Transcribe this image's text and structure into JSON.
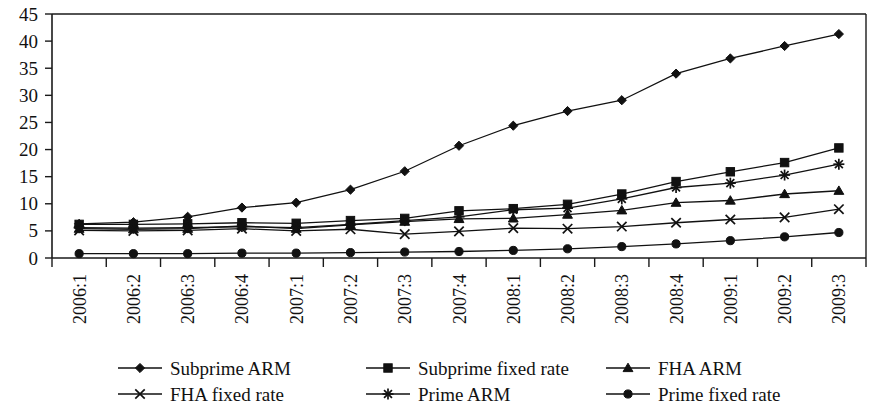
{
  "chart_data": {
    "type": "line",
    "title": "",
    "subtitle": "",
    "xlabel": "",
    "ylabel": "",
    "ylim": [
      0,
      45
    ],
    "yticks": [
      0,
      5,
      10,
      15,
      20,
      25,
      30,
      35,
      40,
      45
    ],
    "grid": false,
    "legend_position": "bottom",
    "legend_columns": 3,
    "categories": [
      "2006:1",
      "2006:2",
      "2006:3",
      "2006:4",
      "2007:1",
      "2007:2",
      "2007:3",
      "2007:4",
      "2008:1",
      "2008:2",
      "2008:3",
      "2008:4",
      "2009:1",
      "2009:2",
      "2009:3"
    ],
    "series": [
      {
        "name": "Subprime ARM",
        "marker": "diamond",
        "values": [
          6.3,
          6.6,
          7.6,
          9.3,
          10.2,
          12.6,
          16.0,
          20.7,
          24.4,
          27.1,
          29.1,
          34.0,
          36.8,
          39.1,
          41.3
        ]
      },
      {
        "name": "Subprime fixed rate",
        "marker": "square",
        "values": [
          6.2,
          6.2,
          6.3,
          6.5,
          6.4,
          6.9,
          7.3,
          8.7,
          9.1,
          9.9,
          11.8,
          14.1,
          15.9,
          17.6,
          20.3
        ]
      },
      {
        "name": "FHA ARM",
        "marker": "triangle",
        "values": [
          5.4,
          5.3,
          5.4,
          5.9,
          5.4,
          6.1,
          6.7,
          7.2,
          7.3,
          8.0,
          8.8,
          10.2,
          10.6,
          11.8,
          12.4
        ]
      },
      {
        "name": "FHA fixed rate",
        "marker": "x",
        "values": [
          5.1,
          5.0,
          5.1,
          5.4,
          5.0,
          5.3,
          4.4,
          4.9,
          5.5,
          5.4,
          5.8,
          6.5,
          7.1,
          7.5,
          9.0
        ]
      },
      {
        "name": "Prime ARM",
        "marker": "asterisk",
        "values": [
          5.6,
          5.5,
          5.6,
          5.8,
          5.6,
          6.2,
          6.9,
          7.6,
          8.9,
          9.2,
          10.9,
          13.0,
          13.8,
          15.3,
          17.3
        ]
      },
      {
        "name": "Prime fixed rate",
        "marker": "circle",
        "values": [
          0.8,
          0.8,
          0.8,
          0.9,
          0.9,
          1.0,
          1.1,
          1.2,
          1.4,
          1.7,
          2.1,
          2.6,
          3.2,
          3.9,
          4.7
        ]
      }
    ]
  },
  "legend": {
    "items": [
      {
        "label": "Subprime ARM",
        "marker": "diamond"
      },
      {
        "label": "Subprime fixed rate",
        "marker": "square"
      },
      {
        "label": "FHA ARM",
        "marker": "triangle"
      },
      {
        "label": "FHA fixed rate",
        "marker": "x"
      },
      {
        "label": "Prime ARM",
        "marker": "asterisk"
      },
      {
        "label": "Prime fixed rate",
        "marker": "circle"
      }
    ]
  },
  "colors": {
    "ink": "#111111",
    "background": "#ffffff"
  }
}
